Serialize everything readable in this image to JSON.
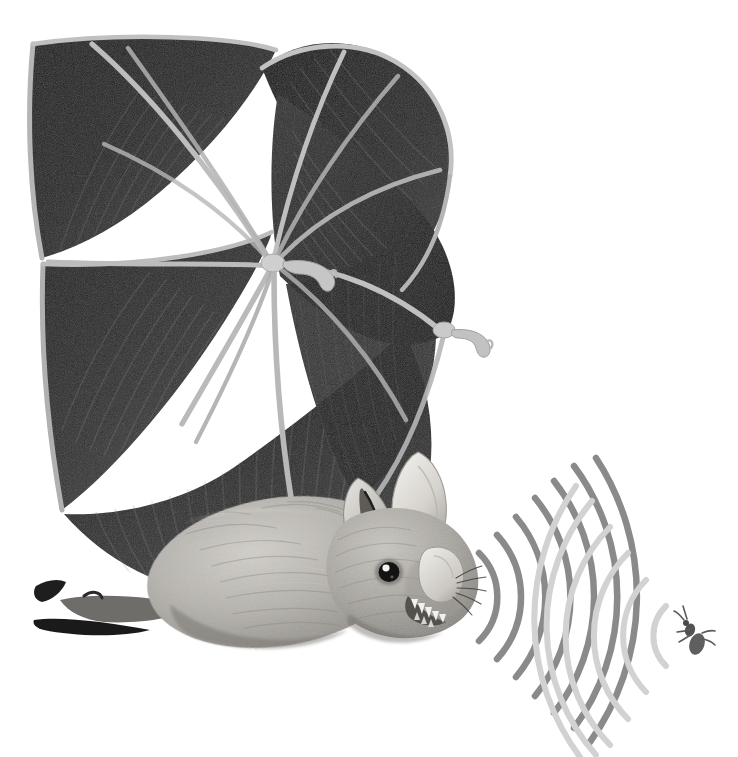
{
  "illustration": {
    "title": "Bat Echolocation",
    "subject": "Bat in flight emitting echolocation calls toward a flying insect",
    "background_color": "#ffffff",
    "width": 738,
    "height": 757
  },
  "palette": {
    "background": "#ffffff",
    "membrane_dark": "#1a1a1a",
    "membrane_mid": "#3a3a3a",
    "membrane_light": "#565656",
    "bone_light": "#b9b9b9",
    "bone_highlight": "#d8d8d8",
    "fur_light": "#c9c6c1",
    "fur_mid": "#a5a29c",
    "fur_shadow": "#7e7b76",
    "ear_light": "#e8e6e2",
    "emitted_wave": "#8a8a8a",
    "echo_wave": "#d2d2d2",
    "insect_body": "#6b6b6b",
    "eye_dark": "#141414",
    "tooth_white": "#f2f2f2"
  },
  "anatomy": {
    "parts": [
      {
        "name": "left-wing",
        "label": "Left wing (far)",
        "description": "Large dark membrane spread upward with radiating finger bones"
      },
      {
        "name": "right-wing",
        "label": "Right wing (near)",
        "description": "Second dark membrane fanned to the right of the first"
      },
      {
        "name": "wing-membrane",
        "label": "Wing membrane (patagium)",
        "description": "Dark translucent skin stretched between elongated finger bones"
      },
      {
        "name": "finger-bones",
        "label": "Elongated finger bones",
        "description": "Pale gray struts radiating from the wrist joint"
      },
      {
        "name": "wrist-joint",
        "label": "Wrist joint",
        "description": "Pale knuckle where the finger bones converge"
      },
      {
        "name": "thumb-claw",
        "label": "Thumb with claw",
        "description": "Small hooked claw projecting from the wrist"
      },
      {
        "name": "body",
        "label": "Furred body",
        "description": "Soft light gray furred torso"
      },
      {
        "name": "head",
        "label": "Head",
        "description": "Pointed muzzle with open mouth showing teeth"
      },
      {
        "name": "ear",
        "label": "Ears",
        "description": "Two large pale pointed ears for receiving echoes"
      },
      {
        "name": "tragus",
        "label": "Tragus",
        "description": "Inner ear spike aiding echo direction-finding"
      },
      {
        "name": "eye",
        "label": "Eye",
        "description": "Small dark eye with a bright catchlight"
      },
      {
        "name": "nose-leaf",
        "label": "Nose leaf",
        "description": "Pale leaf-shaped flap on the muzzle that focuses emitted sound"
      },
      {
        "name": "teeth",
        "label": "Teeth",
        "description": "Row of sharp white teeth in the open mouth"
      },
      {
        "name": "whiskers",
        "label": "Whiskers",
        "description": "Fine vibrissae around the muzzle"
      },
      {
        "name": "tail-membrane",
        "label": "Tail membrane (uropatagium)",
        "description": "Dark skin between the hind legs at lower left"
      },
      {
        "name": "foot",
        "label": "Hind foot",
        "description": "Small clawed foot at lower left"
      }
    ]
  },
  "waves": {
    "emitted": {
      "label": "Emitted echolocation calls",
      "color": "#8a8a8a",
      "description": "Dark gray arcs radiating outward to the right from the bat's mouth",
      "origin": {
        "x": 452,
        "y": 597
      },
      "count": 7,
      "radii": [
        60,
        92,
        124,
        156,
        188,
        220,
        252
      ],
      "stroke_width": 6.5
    },
    "echo": {
      "label": "Returning echoes",
      "color": "#d2d2d2",
      "description": "Pale gray arcs radiating back to the left from the insect",
      "origin": {
        "x": 692,
        "y": 636
      },
      "count": 6,
      "radii": [
        42,
        80,
        118,
        156,
        194,
        232
      ],
      "stroke_width": 6.0
    }
  },
  "insect": {
    "label": "Flying insect (prey)",
    "description": "Tiny dark moth-like insect being targeted by the bat's sonar",
    "position": {
      "x": 694,
      "y": 636
    },
    "color": "#6b6b6b"
  },
  "credits": {
    "visible_text": ""
  }
}
